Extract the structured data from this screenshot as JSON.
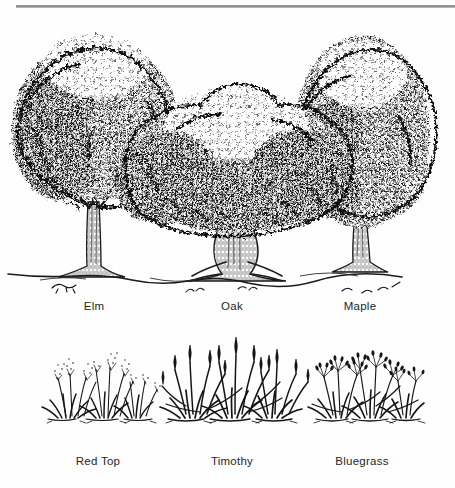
{
  "plate": {
    "title": "Botanical identification plate",
    "medium": "pen-and-ink line drawing",
    "top_rule_color": "#8e8e8e",
    "ink_color": "#111111",
    "background_color": "#fefefe",
    "text_color": "#262626"
  },
  "tree_row": {
    "caption_y": 310,
    "items": [
      {
        "label": "Elm",
        "center_x": 94,
        "canopy_shape": "vase-spreading",
        "canopy_top_y": 28,
        "trunk_x": 93,
        "trunk_top_y": 196,
        "ground_y": 272
      },
      {
        "label": "Oak",
        "center_x": 232,
        "canopy_shape": "broad-spreading",
        "canopy_top_y": 80,
        "trunk_x": 238,
        "trunk_top_y": 196,
        "ground_y": 272
      },
      {
        "label": "Maple",
        "center_x": 360,
        "canopy_shape": "rounded-oval",
        "canopy_top_y": 25,
        "trunk_x": 360,
        "trunk_top_y": 214,
        "ground_y": 272
      }
    ]
  },
  "grass_row": {
    "caption_y": 462,
    "items": [
      {
        "label": "Red Top",
        "center_x": 98,
        "habit": "fine wispy stems with airy seed panicles",
        "clump_base_y": 418,
        "max_height_y": 366
      },
      {
        "label": "Timothy",
        "center_x": 232,
        "habit": "tall upright stems with cylindrical spike heads",
        "clump_base_y": 418,
        "max_height_y": 352
      },
      {
        "label": "Bluegrass",
        "center_x": 362,
        "habit": "medium tufted stems with branching panicles",
        "clump_base_y": 418,
        "max_height_y": 368
      }
    ]
  }
}
